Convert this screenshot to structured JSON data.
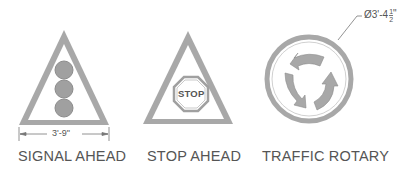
{
  "signs": [
    {
      "name": "SIGNAL AHEAD",
      "dimension": "3'-9\""
    },
    {
      "name": "STOP AHEAD",
      "inner_text": "STOP"
    },
    {
      "name": "TRAFFIC ROTARY",
      "dimension": "Ø3'-4",
      "dimension_fraction_num": "1",
      "dimension_fraction_den": "2",
      "dimension_suffix": "\""
    }
  ],
  "colors": {
    "stroke": "#9a9a9a",
    "fill_gray": "#a8a8a8",
    "text": "#555555"
  }
}
